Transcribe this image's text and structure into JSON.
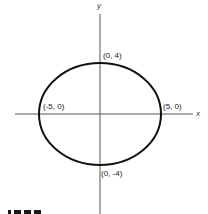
{
  "figure": {
    "type": "ellipse-on-axes",
    "axes": {
      "x_label": "x",
      "y_label": "y"
    },
    "ellipse": {
      "center": [
        0,
        0
      ],
      "semi_major_x": 5,
      "semi_minor_y": 4
    },
    "points": {
      "top": "(0, 4)",
      "bottom": "(0, -4)",
      "left": "(-5, 0)",
      "right": "(5, 0)"
    },
    "colors": {
      "stroke": "#111111",
      "axis": "#555555",
      "background": "#ffffff"
    }
  }
}
